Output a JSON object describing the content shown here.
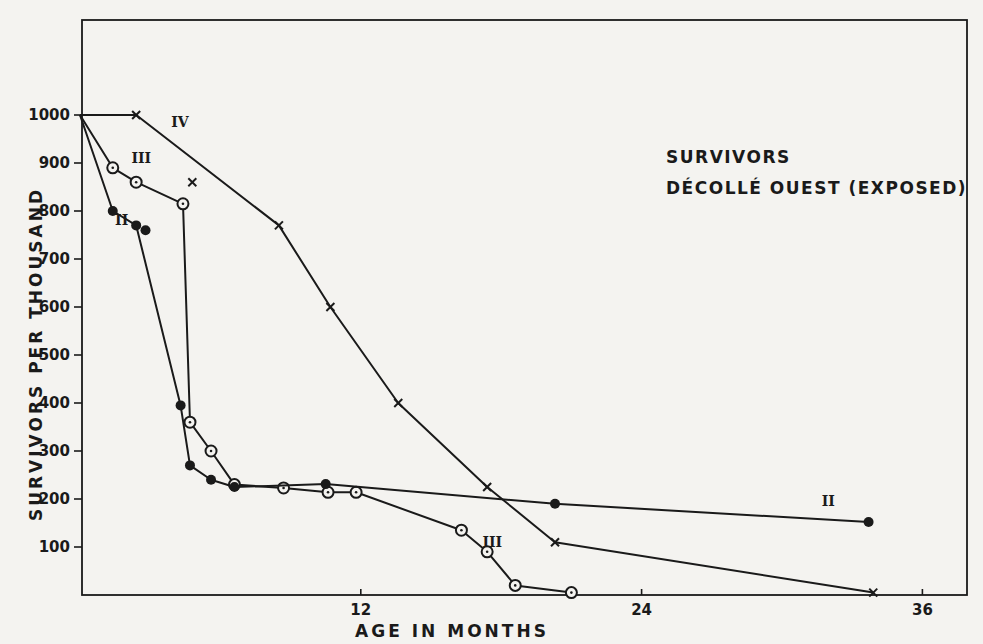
{
  "chart_data": {
    "type": "line",
    "title": "SURVIVORS",
    "subtitle": "DÉCOLLÉ OUEST (EXPOSED)",
    "xlabel": "AGE IN MONTHS",
    "ylabel": "SURVIVORS PER THOUSAND",
    "xlim": [
      0,
      38
    ],
    "ylim": [
      0,
      1000
    ],
    "xticks": [
      12,
      24,
      36
    ],
    "yticks": [
      100,
      200,
      300,
      400,
      500,
      600,
      700,
      800,
      900,
      1000
    ],
    "grid": false,
    "legend": "inline labels",
    "series": [
      {
        "name": "IV",
        "marker": "x",
        "points": [
          [
            0,
            1000
          ],
          [
            2.4,
            1000
          ],
          [
            8.5,
            770
          ],
          [
            10.7,
            600
          ],
          [
            13.6,
            400
          ],
          [
            17.4,
            225
          ],
          [
            20.3,
            110
          ],
          [
            33.9,
            5
          ]
        ],
        "extra_points": [
          [
            4.8,
            860
          ]
        ],
        "label_pos": [
          3.9,
          975
        ]
      },
      {
        "name": "III",
        "marker": "circle-dot",
        "points": [
          [
            0,
            1000
          ],
          [
            1.4,
            890
          ],
          [
            2.4,
            860
          ],
          [
            4.4,
            815
          ],
          [
            4.7,
            360
          ],
          [
            5.6,
            300
          ],
          [
            6.6,
            230
          ],
          [
            8.7,
            223
          ],
          [
            10.6,
            214
          ],
          [
            11.8,
            214
          ],
          [
            16.3,
            135
          ],
          [
            17.4,
            90
          ],
          [
            18.6,
            20
          ],
          [
            21,
            5
          ]
        ],
        "label_pos": [
          2.2,
          900
        ],
        "label2_pos": [
          17.2,
          100
        ]
      },
      {
        "name": "II",
        "marker": "filled-circle",
        "points": [
          [
            0,
            1000
          ],
          [
            1.4,
            800
          ],
          [
            2.4,
            770
          ],
          [
            4.3,
            395
          ],
          [
            4.7,
            270
          ],
          [
            5.6,
            240
          ],
          [
            6.6,
            225
          ],
          [
            10.5,
            231
          ],
          [
            20.3,
            190
          ],
          [
            33.7,
            152
          ]
        ],
        "extra_points": [
          [
            2.8,
            760
          ]
        ],
        "label_pos": [
          1.5,
          770
        ],
        "label2_pos": [
          31.7,
          185
        ]
      }
    ]
  }
}
